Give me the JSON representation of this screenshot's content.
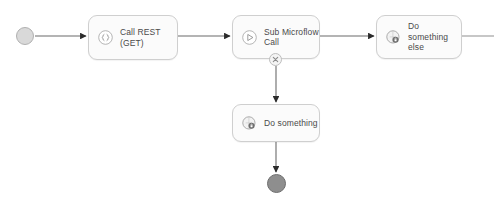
{
  "diagram": {
    "type": "microflow",
    "background": "#ffffff",
    "edge_color": "#6b6b6b",
    "node_fill": "#fbfbfb",
    "node_border": "#cfcfcf",
    "label_color": "#4a4a4a",
    "start_event": {
      "name": "start-event",
      "label": "",
      "fill": "#d9d9d9",
      "x": 16,
      "y": 27
    },
    "end_event": {
      "name": "end-event",
      "label": "",
      "fill": "#8e8e8e",
      "x": 267,
      "y": 174
    },
    "nodes": [
      {
        "id": "call-rest-get",
        "label": "Call REST (GET)",
        "icon": "rest-call-icon",
        "x": 88,
        "y": 15,
        "width": 90,
        "height": 45
      },
      {
        "id": "sub-microflow-call",
        "label": "Sub Microflow\nCall",
        "icon": "microflow-call-icon",
        "x": 232,
        "y": 15,
        "width": 88,
        "height": 44,
        "boundary_error_marker": {
          "name": "error-boundary-marker",
          "glyph": "x-in-circle"
        }
      },
      {
        "id": "do-something-else",
        "label": "Do something\nelse",
        "icon": "java-action-icon",
        "x": 376,
        "y": 15,
        "width": 86,
        "height": 44
      },
      {
        "id": "do-something",
        "label": "Do something",
        "icon": "java-action-icon",
        "x": 232,
        "y": 104,
        "width": 88,
        "height": 38
      }
    ],
    "edges": [
      {
        "id": "edge-start-to-rest",
        "from": "start-event",
        "to": "call-rest-get",
        "arrow": true
      },
      {
        "id": "edge-rest-to-submicroflow",
        "from": "call-rest-get",
        "to": "sub-microflow-call",
        "arrow": true
      },
      {
        "id": "edge-submicroflow-to-dosomethingelse",
        "from": "sub-microflow-call",
        "to": "do-something-else",
        "arrow": true
      },
      {
        "id": "edge-dosomethingelse-to-offscreen",
        "from": "do-something-else",
        "to": "canvas-edge",
        "arrow": false
      },
      {
        "id": "edge-error-to-dosomething",
        "from": "error-boundary-marker",
        "to": "do-something",
        "arrow": true
      },
      {
        "id": "edge-dosomething-to-end",
        "from": "do-something",
        "to": "end-event",
        "arrow": true
      }
    ]
  }
}
